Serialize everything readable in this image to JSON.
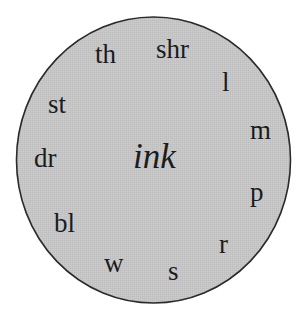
{
  "diagram": {
    "type": "word-wheel",
    "center": {
      "label": "ink",
      "style": "italic"
    },
    "onsets": [
      {
        "label": "th",
        "x": 95,
        "y": 63
      },
      {
        "label": "shr",
        "x": 156,
        "y": 58
      },
      {
        "label": "l",
        "x": 222,
        "y": 91
      },
      {
        "label": "m",
        "x": 250,
        "y": 139
      },
      {
        "label": "st",
        "x": 48,
        "y": 113
      },
      {
        "label": "dr",
        "x": 34,
        "y": 167
      },
      {
        "label": "p",
        "x": 250,
        "y": 201
      },
      {
        "label": "bl",
        "x": 54,
        "y": 232
      },
      {
        "label": "r",
        "x": 219,
        "y": 253
      },
      {
        "label": "w",
        "x": 104,
        "y": 272
      },
      {
        "label": "s",
        "x": 168,
        "y": 280
      }
    ],
    "colors": {
      "circle_fill": "#c4c4c4",
      "circle_stroke": "#2a2a2a",
      "text": "#1c1c1c",
      "background": "#ffffff"
    }
  }
}
